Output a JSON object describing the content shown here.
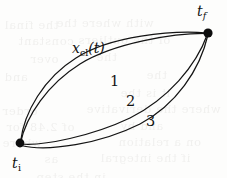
{
  "figure": {
    "type": "path-integral-diagram",
    "background_color": "#fdfdfc",
    "stroke_color": "#141414",
    "endpoints": {
      "initial": {
        "label_t": "t",
        "label_sub": "i",
        "label_full": "t_i",
        "x": 20,
        "y": 143
      },
      "final": {
        "label_t": "t",
        "label_sub": "f",
        "label_full": "t_f",
        "x": 208,
        "y": 33
      }
    },
    "classical_path_label": {
      "prefix": "x",
      "subscript": "cl",
      "argument": "(t)",
      "full": "x_cl(t)"
    },
    "path_labels": [
      {
        "text": "1",
        "x": 110,
        "y": 81
      },
      {
        "text": "2",
        "x": 126,
        "y": 101
      },
      {
        "text": "3",
        "x": 146,
        "y": 121
      }
    ],
    "ghost_text_lines": [
      {
        "text": "the final",
        "x": 4,
        "y": 18
      },
      {
        "text": "with where the",
        "x": 56,
        "y": 16
      },
      {
        "text": "constant",
        "x": 18,
        "y": 34
      },
      {
        "text": "of the outliers",
        "x": 78,
        "y": 33
      },
      {
        "text": "over",
        "x": 30,
        "y": 52
      },
      {
        "text": "the",
        "x": 96,
        "y": 50
      },
      {
        "text": "and",
        "x": 4,
        "y": 70
      },
      {
        "text": "the",
        "x": 146,
        "y": 68
      },
      {
        "text": "it is the",
        "x": 120,
        "y": 86
      },
      {
        "text": "order",
        "x": 2,
        "y": 104
      },
      {
        "text": "where the derivative",
        "x": 86,
        "y": 102
      },
      {
        "text": "of 2.48 for",
        "x": 6,
        "y": 120
      },
      {
        "text": "and by",
        "x": 120,
        "y": 119
      },
      {
        "text": "where",
        "x": 2,
        "y": 136
      },
      {
        "text": "on a relation",
        "x": 118,
        "y": 135
      },
      {
        "text": "as",
        "x": 44,
        "y": 152
      },
      {
        "text": "if the integral",
        "x": 100,
        "y": 151
      },
      {
        "text": "in the step",
        "x": 36,
        "y": 170
      }
    ]
  }
}
